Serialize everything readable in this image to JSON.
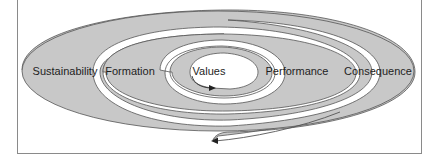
{
  "diagram": {
    "type": "spiral",
    "direction": "outside-in and inside-out arrow",
    "colors": {
      "fill": "#c8c8c8",
      "stroke": "#555555",
      "gap": "#ffffff",
      "text": "#1e1e1e",
      "frame": "#8a8a8a"
    },
    "labels": {
      "sustainability": "Sustainability",
      "formation": "Formation",
      "values": "Values",
      "performance": "Performance",
      "consequence": "Consequence"
    }
  }
}
